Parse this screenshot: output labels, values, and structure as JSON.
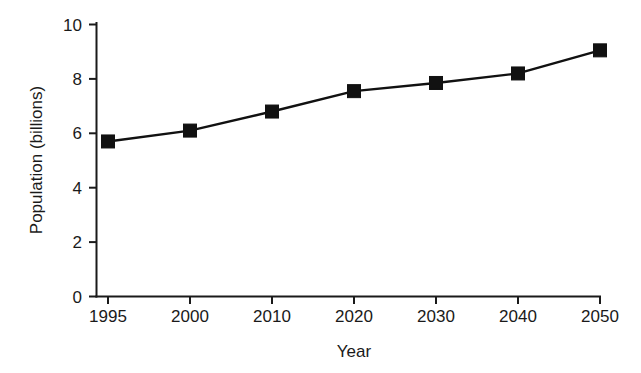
{
  "chart_data": {
    "type": "line",
    "title": "",
    "xlabel": "Year",
    "ylabel": "Population (billions)",
    "categories": [
      "1995",
      "2000",
      "2010",
      "2020",
      "2030",
      "2040",
      "2050"
    ],
    "x": [
      1995,
      2000,
      2010,
      2020,
      2030,
      2040,
      2050
    ],
    "values": [
      5.7,
      6.1,
      6.8,
      7.55,
      7.85,
      8.2,
      9.05
    ],
    "series": [
      {
        "name": "Population",
        "values": [
          5.7,
          6.1,
          6.8,
          7.55,
          7.85,
          8.2,
          9.05
        ]
      }
    ],
    "ylim": [
      0,
      10
    ],
    "yticks": [
      0,
      2,
      4,
      6,
      8,
      10
    ],
    "ytick_labels": [
      "0",
      "2",
      "4",
      "6",
      "8",
      "10"
    ],
    "xtick_labels": [
      "1995",
      "2000",
      "2010",
      "2020",
      "2030",
      "2040",
      "2050"
    ],
    "grid": false,
    "legend": false,
    "legend_position": "none",
    "marker": "filled-square",
    "line_color": "#111111",
    "marker_color": "#111111",
    "axis_color": "#1a1a1a",
    "background_color": "#ffffff",
    "x_scale": "categorical"
  }
}
